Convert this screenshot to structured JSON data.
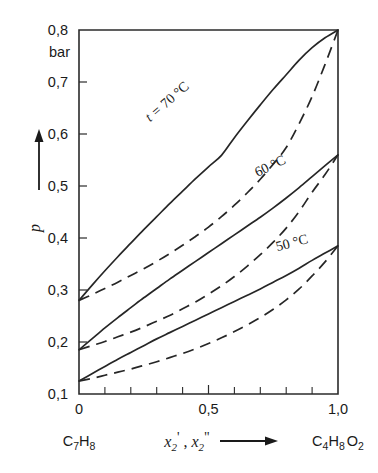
{
  "chart_data": {
    "type": "line",
    "title": "",
    "subtitle": "",
    "xlabel": "x'_2 , x''_2",
    "ylabel": "p",
    "yunit": "bar",
    "xlim": [
      0.0,
      1.0
    ],
    "ylim": [
      0.1,
      0.8
    ],
    "grid": false,
    "legend_position": "inline-curve-labels",
    "x_tick_labels": [
      "0",
      "0,5",
      "1,0"
    ],
    "x_tick_values": [
      0.0,
      0.5,
      1.0
    ],
    "x_minor_tick_values": [
      0.1,
      0.2,
      0.3,
      0.4,
      0.6,
      0.7,
      0.8,
      0.9
    ],
    "y_tick_labels": [
      "0,1",
      "0,2",
      "0,3",
      "0,4",
      "0,5",
      "0,6",
      "0,7",
      "0,8"
    ],
    "y_tick_values": [
      0.1,
      0.2,
      0.3,
      0.4,
      0.5,
      0.6,
      0.7,
      0.8
    ],
    "left_component": "C7H8",
    "right_component": "C4H8O2",
    "annotations": [
      {
        "text": "t = 70 °C",
        "x": 0.3,
        "y": 0.6
      },
      {
        "text": "60 °C",
        "x": 0.72,
        "y": 0.545
      },
      {
        "text": "50 °C",
        "x": 0.82,
        "y": 0.4
      }
    ],
    "series": [
      {
        "name": "t = 70 °C bubble line (liquid, x'2)",
        "temperature_c": 70,
        "line_style": "solid",
        "x": [
          0.0,
          0.05,
          0.1,
          0.15,
          0.2,
          0.25,
          0.3,
          0.35,
          0.4,
          0.45,
          0.5,
          0.55,
          0.6,
          0.65,
          0.7,
          0.75,
          0.8,
          0.85,
          0.9,
          0.95,
          1.0
        ],
        "y": [
          0.28,
          0.309,
          0.337,
          0.364,
          0.39,
          0.416,
          0.441,
          0.466,
          0.49,
          0.514,
          0.537,
          0.559,
          0.593,
          0.625,
          0.656,
          0.686,
          0.714,
          0.742,
          0.766,
          0.785,
          0.8
        ]
      },
      {
        "name": "t = 70 °C dew line (vapour, x''2)",
        "temperature_c": 70,
        "line_style": "dashed",
        "x": [
          0.0,
          0.05,
          0.1,
          0.15,
          0.2,
          0.25,
          0.3,
          0.35,
          0.4,
          0.45,
          0.5,
          0.55,
          0.6,
          0.65,
          0.7,
          0.75,
          0.8,
          0.85,
          0.9,
          0.95,
          1.0
        ],
        "y": [
          0.28,
          0.291,
          0.303,
          0.315,
          0.328,
          0.341,
          0.355,
          0.37,
          0.386,
          0.403,
          0.421,
          0.441,
          0.463,
          0.487,
          0.513,
          0.542,
          0.574,
          0.62,
          0.672,
          0.734,
          0.8
        ]
      },
      {
        "name": "t = 60 °C bubble line (liquid, x'2)",
        "temperature_c": 60,
        "line_style": "solid",
        "x": [
          0.0,
          0.05,
          0.1,
          0.15,
          0.2,
          0.25,
          0.3,
          0.35,
          0.4,
          0.45,
          0.5,
          0.55,
          0.6,
          0.65,
          0.7,
          0.75,
          0.8,
          0.85,
          0.9,
          0.95,
          1.0
        ],
        "y": [
          0.185,
          0.206,
          0.227,
          0.247,
          0.266,
          0.285,
          0.303,
          0.321,
          0.338,
          0.355,
          0.372,
          0.389,
          0.406,
          0.423,
          0.44,
          0.458,
          0.477,
          0.497,
          0.518,
          0.539,
          0.56
        ]
      },
      {
        "name": "t = 60 °C dew line (vapour, x''2)",
        "temperature_c": 60,
        "line_style": "dashed",
        "x": [
          0.0,
          0.05,
          0.1,
          0.15,
          0.2,
          0.25,
          0.3,
          0.35,
          0.4,
          0.45,
          0.5,
          0.55,
          0.6,
          0.65,
          0.7,
          0.75,
          0.8,
          0.85,
          0.9,
          0.95,
          1.0
        ],
        "y": [
          0.185,
          0.193,
          0.201,
          0.21,
          0.219,
          0.229,
          0.24,
          0.251,
          0.264,
          0.277,
          0.292,
          0.308,
          0.326,
          0.346,
          0.368,
          0.392,
          0.419,
          0.451,
          0.488,
          0.522,
          0.56
        ]
      },
      {
        "name": "t = 50 °C bubble line (liquid, x'2)",
        "temperature_c": 50,
        "line_style": "solid",
        "x": [
          0.0,
          0.05,
          0.1,
          0.15,
          0.2,
          0.25,
          0.3,
          0.35,
          0.4,
          0.45,
          0.5,
          0.55,
          0.6,
          0.65,
          0.7,
          0.75,
          0.8,
          0.85,
          0.9,
          0.95,
          1.0
        ],
        "y": [
          0.125,
          0.139,
          0.153,
          0.167,
          0.18,
          0.193,
          0.206,
          0.218,
          0.23,
          0.242,
          0.254,
          0.266,
          0.278,
          0.29,
          0.302,
          0.315,
          0.328,
          0.342,
          0.357,
          0.371,
          0.385
        ]
      },
      {
        "name": "t = 50 °C dew line (vapour, x''2)",
        "temperature_c": 50,
        "line_style": "dashed",
        "x": [
          0.0,
          0.05,
          0.1,
          0.15,
          0.2,
          0.25,
          0.3,
          0.35,
          0.4,
          0.45,
          0.5,
          0.55,
          0.6,
          0.65,
          0.7,
          0.75,
          0.8,
          0.85,
          0.9,
          0.95,
          1.0
        ],
        "y": [
          0.125,
          0.13,
          0.136,
          0.142,
          0.148,
          0.155,
          0.162,
          0.17,
          0.178,
          0.187,
          0.197,
          0.208,
          0.22,
          0.233,
          0.247,
          0.263,
          0.281,
          0.302,
          0.327,
          0.354,
          0.385
        ]
      }
    ]
  },
  "labels": {
    "y_unit": "bar",
    "y_symbol": "p",
    "x_symbol_main": "x",
    "x_symbol_sub": "2",
    "x_prime": "'",
    "x_dprime": "\"",
    "x_comma": " , ",
    "left_formula_parts": [
      "C",
      "7",
      "H",
      "8"
    ],
    "right_formula_parts": [
      "C",
      "4",
      "H",
      "8",
      "O",
      "2"
    ],
    "t_label_prefix": "t = ",
    "t_label_70": "70 °C",
    "t_label_60": "60 °C",
    "t_label_50": "50 °C"
  },
  "colors": {
    "ink": "#262626",
    "background": "#ffffff"
  }
}
